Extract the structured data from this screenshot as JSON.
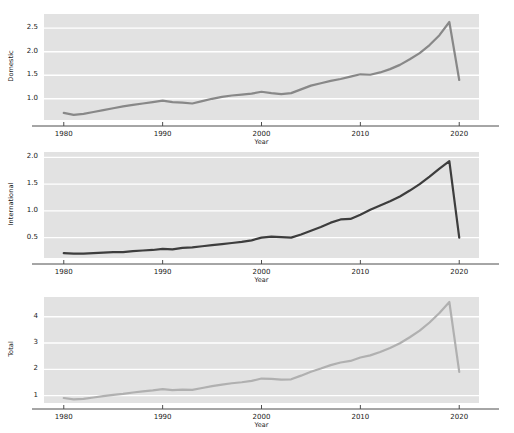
{
  "figure": {
    "width": 514,
    "height": 433,
    "background": "#ffffff",
    "panel_background": "#e2e2e2",
    "gridline_color": "#ffffff",
    "axis_color": "#4d4d4d"
  },
  "chart_data": [
    {
      "type": "line",
      "panel": "Domestic",
      "title": "",
      "xlabel": "Year",
      "ylabel": "Domestic",
      "xlim": [
        1978,
        2022
      ],
      "ylim": [
        0.55,
        2.8
      ],
      "xticks": [
        1980,
        1990,
        2000,
        2010,
        2020
      ],
      "xticklabels": [
        "1980",
        "1990",
        "2000",
        "2010",
        "2020"
      ],
      "yticks": [
        1.0,
        1.5,
        2.0,
        2.5
      ],
      "yticklabels": [
        "1.0",
        "1.5",
        "2.0",
        "2.5"
      ],
      "grid": true,
      "line_color": "#888888",
      "line_width": 2.2,
      "x": [
        1980,
        1981,
        1982,
        1983,
        1984,
        1985,
        1986,
        1987,
        1988,
        1989,
        1990,
        1991,
        1992,
        1993,
        1994,
        1995,
        1996,
        1997,
        1998,
        1999,
        2000,
        2001,
        2002,
        2003,
        2004,
        2005,
        2006,
        2007,
        2008,
        2009,
        2010,
        2011,
        2012,
        2013,
        2014,
        2015,
        2016,
        2017,
        2018,
        2019,
        2020
      ],
      "y": [
        0.7,
        0.66,
        0.68,
        0.72,
        0.76,
        0.8,
        0.84,
        0.87,
        0.9,
        0.93,
        0.96,
        0.93,
        0.92,
        0.9,
        0.95,
        1.0,
        1.04,
        1.07,
        1.09,
        1.11,
        1.15,
        1.12,
        1.1,
        1.12,
        1.2,
        1.28,
        1.33,
        1.38,
        1.42,
        1.47,
        1.52,
        1.51,
        1.56,
        1.63,
        1.72,
        1.84,
        1.97,
        2.14,
        2.35,
        2.63,
        1.4
      ]
    },
    {
      "type": "line",
      "panel": "International",
      "title": "",
      "xlabel": "Year",
      "ylabel": "International",
      "xlim": [
        1978,
        2022
      ],
      "ylim": [
        0.12,
        2.1
      ],
      "xticks": [
        1980,
        1990,
        2000,
        2010,
        2020
      ],
      "xticklabels": [
        "1980",
        "1990",
        "2000",
        "2010",
        "2020"
      ],
      "yticks": [
        0.5,
        1.0,
        1.5,
        2.0
      ],
      "yticklabels": [
        "0.5",
        "1.0",
        "1.5",
        "2.0"
      ],
      "grid": true,
      "line_color": "#3d3d3d",
      "line_width": 2.2,
      "x": [
        1980,
        1981,
        1982,
        1983,
        1984,
        1985,
        1986,
        1987,
        1988,
        1989,
        1990,
        1991,
        1992,
        1993,
        1994,
        1995,
        1996,
        1997,
        1998,
        1999,
        2000,
        2001,
        2002,
        2003,
        2004,
        2005,
        2006,
        2007,
        2008,
        2009,
        2010,
        2011,
        2012,
        2013,
        2014,
        2015,
        2016,
        2017,
        2018,
        2019,
        2020
      ],
      "y": [
        0.21,
        0.2,
        0.2,
        0.21,
        0.22,
        0.23,
        0.23,
        0.25,
        0.26,
        0.27,
        0.29,
        0.28,
        0.31,
        0.32,
        0.34,
        0.36,
        0.38,
        0.4,
        0.42,
        0.45,
        0.5,
        0.52,
        0.51,
        0.5,
        0.56,
        0.63,
        0.7,
        0.78,
        0.84,
        0.85,
        0.93,
        1.02,
        1.1,
        1.18,
        1.27,
        1.38,
        1.5,
        1.64,
        1.79,
        1.93,
        0.5
      ]
    },
    {
      "type": "line",
      "panel": "Total",
      "title": "",
      "xlabel": "Year",
      "ylabel": "Total",
      "xlim": [
        1978,
        2022
      ],
      "ylim": [
        0.72,
        4.75
      ],
      "xticks": [
        1980,
        1990,
        2000,
        2010,
        2020
      ],
      "xticklabels": [
        "1980",
        "1990",
        "2000",
        "2010",
        "2020"
      ],
      "yticks": [
        1,
        2,
        3,
        4
      ],
      "yticklabels": [
        "1",
        "2",
        "3",
        "4"
      ],
      "grid": true,
      "line_color": "#b0b0b0",
      "line_width": 2.2,
      "x": [
        1980,
        1981,
        1982,
        1983,
        1984,
        1985,
        1986,
        1987,
        1988,
        1989,
        1990,
        1991,
        1992,
        1993,
        1994,
        1995,
        1996,
        1997,
        1998,
        1999,
        2000,
        2001,
        2002,
        2003,
        2004,
        2005,
        2006,
        2007,
        2008,
        2009,
        2010,
        2011,
        2012,
        2013,
        2014,
        2015,
        2016,
        2017,
        2018,
        2019,
        2020
      ],
      "y": [
        0.91,
        0.86,
        0.88,
        0.93,
        0.98,
        1.03,
        1.07,
        1.12,
        1.16,
        1.2,
        1.25,
        1.21,
        1.23,
        1.22,
        1.29,
        1.36,
        1.42,
        1.47,
        1.51,
        1.56,
        1.65,
        1.64,
        1.61,
        1.62,
        1.76,
        1.91,
        2.03,
        2.16,
        2.26,
        2.32,
        2.45,
        2.53,
        2.66,
        2.81,
        2.99,
        3.22,
        3.47,
        3.78,
        4.14,
        4.56,
        1.9
      ]
    }
  ],
  "axes_geometry": [
    {
      "left": 44,
      "top": 14,
      "width": 435,
      "height": 106
    },
    {
      "left": 44,
      "top": 152,
      "width": 435,
      "height": 106
    },
    {
      "left": 44,
      "top": 297,
      "width": 435,
      "height": 106
    }
  ]
}
